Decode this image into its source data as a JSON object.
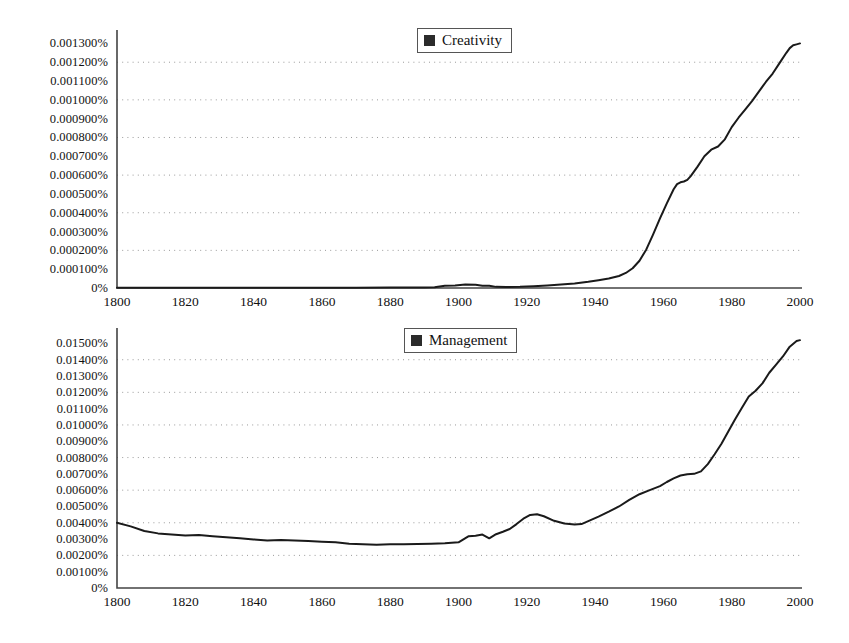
{
  "figure": {
    "background": "#ffffff",
    "line_color": "#1a1a1a",
    "axis_color": "#444444",
    "grid_color": "#9a9a9a",
    "legend_swatch_color": "#2b2b2b"
  },
  "chart_data": [
    {
      "type": "line",
      "id": "creativity",
      "title": "",
      "xlabel": "",
      "ylabel": "",
      "legend": "Creativity",
      "legend_position": "top-center",
      "grid": true,
      "grid_note": "horizontal dotted gridlines on every other y tick",
      "xlim": [
        1800,
        2000
      ],
      "ylim": [
        0,
        0.00135
      ],
      "xticks": [
        1800,
        1820,
        1840,
        1860,
        1880,
        1900,
        1920,
        1940,
        1960,
        1980,
        2000
      ],
      "xtick_labels": [
        "1800",
        "1820",
        "1840",
        "1860",
        "1880",
        "1900",
        "1920",
        "1940",
        "1960",
        "1980",
        "2000"
      ],
      "yticks": [
        0,
        0.0001,
        0.0002,
        0.0003,
        0.0004,
        0.0005,
        0.0006,
        0.0007,
        0.0008,
        0.0009,
        0.001,
        0.0011,
        0.0012,
        0.0013
      ],
      "ytick_labels": [
        "0%",
        "0.000100%",
        "0.000200%",
        "0.000300%",
        "0.000400%",
        "0.000500%",
        "0.000600%",
        "0.000700%",
        "0.000800%",
        "0.000900%",
        "0.001000%",
        "0.001100%",
        "0.001200%",
        "0.001300%"
      ],
      "gridline_values": [
        0.0002,
        0.0004,
        0.0006,
        0.0008,
        0.001,
        0.0012
      ],
      "series": [
        {
          "name": "Creativity",
          "x": [
            1800,
            1810,
            1820,
            1830,
            1840,
            1850,
            1860,
            1870,
            1880,
            1885,
            1890,
            1893,
            1896,
            1899,
            1902,
            1905,
            1907,
            1909,
            1911,
            1914,
            1918,
            1922,
            1926,
            1930,
            1934,
            1938,
            1941,
            1944,
            1947,
            1949,
            1951,
            1953,
            1955,
            1957,
            1959,
            1961,
            1963,
            1964,
            1965,
            1966,
            1967,
            1968,
            1970,
            1972,
            1974,
            1976,
            1978,
            1980,
            1982,
            1984,
            1986,
            1988,
            1990,
            1992,
            1994,
            1996,
            1997,
            1998,
            1999,
            2000
          ],
          "y": [
            1e-06,
            1e-06,
            1e-06,
            1e-06,
            1e-06,
            1e-06,
            1e-06,
            1e-06,
            2e-06,
            2e-06,
            3e-06,
            4e-06,
            1.2e-05,
            1.3e-05,
            1.8e-05,
            1.7e-05,
            1.2e-05,
            1.2e-05,
            6e-06,
            5e-06,
            6e-06,
            9e-06,
            1.3e-05,
            1.8e-05,
            2.4e-05,
            3.3e-05,
            4.1e-05,
            5e-05,
            6.4e-05,
            8e-05,
            0.000105,
            0.000145,
            0.000205,
            0.000285,
            0.00037,
            0.00045,
            0.000525,
            0.000552,
            0.000562,
            0.000566,
            0.000575,
            0.000595,
            0.000645,
            0.0007,
            0.000735,
            0.000752,
            0.00079,
            0.000855,
            0.000905,
            0.00095,
            0.000995,
            0.001045,
            0.001095,
            0.00114,
            0.001195,
            0.00125,
            0.001275,
            0.00129,
            0.001295,
            0.0013
          ]
        }
      ]
    },
    {
      "type": "line",
      "id": "management",
      "title": "",
      "xlabel": "",
      "ylabel": "",
      "legend": "Management",
      "legend_position": "top-center",
      "grid": true,
      "grid_note": "horizontal dotted gridlines on every other y tick",
      "xlim": [
        1800,
        2000
      ],
      "ylim": [
        0,
        0.0157
      ],
      "xticks": [
        1800,
        1820,
        1840,
        1860,
        1880,
        1900,
        1920,
        1940,
        1960,
        1980,
        2000
      ],
      "xtick_labels": [
        "1800",
        "1820",
        "1840",
        "1860",
        "1880",
        "1900",
        "1920",
        "1940",
        "1960",
        "1980",
        "2000"
      ],
      "yticks": [
        0,
        0.001,
        0.002,
        0.003,
        0.004,
        0.005,
        0.006,
        0.007,
        0.008,
        0.009,
        0.01,
        0.011,
        0.012,
        0.013,
        0.014,
        0.015
      ],
      "ytick_labels": [
        "0%",
        "0.00100%",
        "0.00200%",
        "0.00300%",
        "0.00400%",
        "0.00500%",
        "0.00600%",
        "0.00700%",
        "0.00800%",
        "0.00900%",
        "0.01000%",
        "0.01100%",
        "0.01200%",
        "0.01300%",
        "0.01400%",
        "0.01500%"
      ],
      "gridline_values": [
        0.002,
        0.004,
        0.006,
        0.008,
        0.01,
        0.012,
        0.014
      ],
      "series": [
        {
          "name": "Management",
          "x": [
            1800,
            1804,
            1808,
            1812,
            1816,
            1820,
            1824,
            1828,
            1832,
            1836,
            1840,
            1844,
            1848,
            1852,
            1856,
            1860,
            1864,
            1868,
            1872,
            1876,
            1880,
            1884,
            1888,
            1892,
            1896,
            1900,
            1903,
            1905,
            1907,
            1909,
            1911,
            1913,
            1915,
            1917,
            1919,
            1921,
            1923,
            1925,
            1928,
            1931,
            1934,
            1936,
            1938,
            1941,
            1944,
            1947,
            1950,
            1953,
            1956,
            1959,
            1961,
            1963,
            1965,
            1967,
            1969,
            1971,
            1973,
            1975,
            1977,
            1979,
            1981,
            1983,
            1985,
            1987,
            1989,
            1991,
            1993,
            1995,
            1997,
            1999,
            2000
          ],
          "y": [
            0.004,
            0.00378,
            0.0035,
            0.00335,
            0.00328,
            0.00322,
            0.00325,
            0.00318,
            0.00312,
            0.00305,
            0.00298,
            0.00292,
            0.00294,
            0.00292,
            0.00288,
            0.00284,
            0.0028,
            0.00272,
            0.00268,
            0.00265,
            0.00268,
            0.00268,
            0.0027,
            0.00272,
            0.00275,
            0.0028,
            0.00318,
            0.0032,
            0.00328,
            0.00305,
            0.0033,
            0.00345,
            0.00362,
            0.00392,
            0.00425,
            0.00448,
            0.00452,
            0.0044,
            0.00412,
            0.00395,
            0.0039,
            0.00392,
            0.0041,
            0.00438,
            0.00468,
            0.005,
            0.0054,
            0.00575,
            0.006,
            0.00625,
            0.0065,
            0.00672,
            0.0069,
            0.00698,
            0.007,
            0.00715,
            0.0076,
            0.0082,
            0.00885,
            0.0096,
            0.01035,
            0.01105,
            0.01175,
            0.0121,
            0.01255,
            0.0132,
            0.0137,
            0.0142,
            0.0148,
            0.01515,
            0.0152
          ]
        }
      ]
    }
  ]
}
